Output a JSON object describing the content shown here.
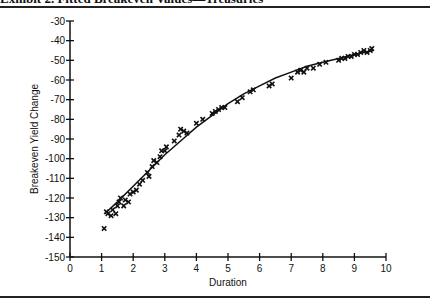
{
  "exhibit": {
    "title": "Exhibit 2. Fitted Breakeven Values—Treasuries"
  },
  "chart_data": {
    "type": "scatter",
    "title": "Exhibit 2. Fitted Breakeven Values—Treasuries",
    "xlabel": "Duration",
    "ylabel": "Breakeven Yield Change",
    "xlim": [
      0,
      10
    ],
    "ylim": [
      -150,
      -30
    ],
    "xticks": [
      0,
      1,
      2,
      3,
      4,
      5,
      6,
      7,
      8,
      9,
      10
    ],
    "yticks": [
      -30,
      -40,
      -50,
      -60,
      -70,
      -80,
      -90,
      -100,
      -110,
      -120,
      -130,
      -140,
      -150
    ],
    "grid": false,
    "legend": null,
    "series": [
      {
        "name": "Observed breakeven values",
        "marker": "x",
        "points": [
          [
            1.08,
            -135.5
          ],
          [
            1.15,
            -127
          ],
          [
            1.2,
            -128
          ],
          [
            1.3,
            -129
          ],
          [
            1.35,
            -126
          ],
          [
            1.45,
            -128
          ],
          [
            1.5,
            -124
          ],
          [
            1.55,
            -122
          ],
          [
            1.6,
            -120
          ],
          [
            1.7,
            -124
          ],
          [
            1.75,
            -121
          ],
          [
            1.85,
            -122
          ],
          [
            1.9,
            -118
          ],
          [
            2.0,
            -117
          ],
          [
            2.1,
            -116
          ],
          [
            2.2,
            -113
          ],
          [
            2.3,
            -111
          ],
          [
            2.45,
            -107
          ],
          [
            2.5,
            -109
          ],
          [
            2.6,
            -104
          ],
          [
            2.65,
            -101
          ],
          [
            2.75,
            -102
          ],
          [
            2.85,
            -99
          ],
          [
            2.9,
            -96
          ],
          [
            3.0,
            -96
          ],
          [
            3.05,
            -94
          ],
          [
            3.3,
            -91
          ],
          [
            3.45,
            -88
          ],
          [
            3.5,
            -85
          ],
          [
            3.6,
            -86
          ],
          [
            3.7,
            -87
          ],
          [
            4.0,
            -82
          ],
          [
            4.2,
            -80
          ],
          [
            4.5,
            -77
          ],
          [
            4.6,
            -76
          ],
          [
            4.7,
            -75
          ],
          [
            4.8,
            -74
          ],
          [
            4.9,
            -74
          ],
          [
            5.3,
            -71
          ],
          [
            5.45,
            -69
          ],
          [
            5.7,
            -66
          ],
          [
            5.8,
            -65
          ],
          [
            6.3,
            -63
          ],
          [
            6.4,
            -62
          ],
          [
            7.0,
            -59
          ],
          [
            7.2,
            -56
          ],
          [
            7.3,
            -55
          ],
          [
            7.4,
            -56
          ],
          [
            7.5,
            -54
          ],
          [
            7.7,
            -54
          ],
          [
            7.9,
            -52
          ],
          [
            8.1,
            -51
          ],
          [
            8.5,
            -50
          ],
          [
            8.6,
            -49
          ],
          [
            8.7,
            -49
          ],
          [
            8.8,
            -48
          ],
          [
            8.9,
            -48
          ],
          [
            9.0,
            -47
          ],
          [
            9.1,
            -47
          ],
          [
            9.2,
            -46
          ],
          [
            9.3,
            -45
          ],
          [
            9.4,
            -46
          ],
          [
            9.5,
            -45
          ],
          [
            9.55,
            -44
          ]
        ]
      },
      {
        "name": "Fitted curve",
        "type": "line",
        "points": [
          [
            1.1,
            -128
          ],
          [
            1.5,
            -122
          ],
          [
            2.0,
            -114
          ],
          [
            2.5,
            -106
          ],
          [
            3.0,
            -98
          ],
          [
            3.5,
            -91
          ],
          [
            4.0,
            -84
          ],
          [
            4.5,
            -78
          ],
          [
            5.0,
            -72
          ],
          [
            5.5,
            -67
          ],
          [
            6.0,
            -63
          ],
          [
            6.5,
            -59
          ],
          [
            7.0,
            -56
          ],
          [
            7.5,
            -53
          ],
          [
            8.0,
            -51
          ],
          [
            8.5,
            -49
          ],
          [
            9.0,
            -47
          ],
          [
            9.6,
            -45
          ]
        ]
      }
    ]
  },
  "style": {
    "ink": "#111111",
    "background": "#ffffff"
  }
}
